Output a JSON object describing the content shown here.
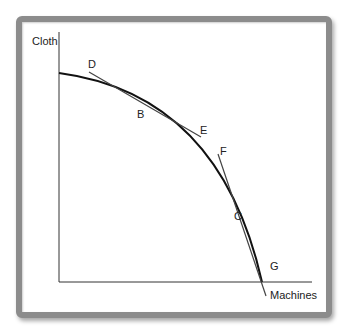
{
  "diagram": {
    "type": "production-possibilities-frontier",
    "y_axis_label": "Cloth",
    "x_axis_label": "Machines",
    "points": [
      {
        "label": "D"
      },
      {
        "label": "B"
      },
      {
        "label": "E"
      },
      {
        "label": "F"
      },
      {
        "label": "C"
      },
      {
        "label": "G"
      }
    ],
    "tangent_lines": [
      {
        "from": "D",
        "to": "E",
        "tangent_at": "B"
      },
      {
        "from": "F",
        "to": "G",
        "tangent_at": "C"
      }
    ],
    "colors": {
      "curve": "#111111",
      "axes": "#333333",
      "tangent": "#444444",
      "frame": "#8c8c8c"
    }
  }
}
